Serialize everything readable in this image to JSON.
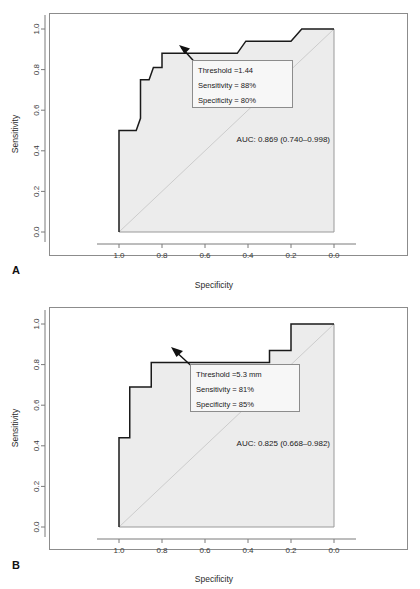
{
  "figure": {
    "panels": [
      {
        "letter": "A",
        "axes": {
          "xlabel": "Specificity",
          "ylabel": "Sensitivity",
          "xticks": [
            "1.0",
            "0.8",
            "0.6",
            "0.4",
            "0.2",
            "0.0"
          ],
          "yticks": [
            "0.0",
            "0.2",
            "0.4",
            "0.6",
            "0.8",
            "1.0"
          ],
          "xlim": [
            1.0,
            0.0
          ],
          "ylim": [
            0.0,
            1.0
          ]
        },
        "annotation": {
          "threshold": "Threshold =1.44",
          "sensitivity": "Sensitivity = 88%",
          "specificity": "Specificity = 80%"
        },
        "auc_label": "AUC: 0.869 (0.740–0.998)"
      },
      {
        "letter": "B",
        "axes": {
          "xlabel": "Specificity",
          "ylabel": "Sensitivity",
          "xticks": [
            "1.0",
            "0.8",
            "0.6",
            "0.4",
            "0.2",
            "0.0"
          ],
          "yticks": [
            "0.0",
            "0.2",
            "0.4",
            "0.6",
            "0.8",
            "1.0"
          ],
          "xlim": [
            1.0,
            0.0
          ],
          "ylim": [
            0.0,
            1.0
          ]
        },
        "annotation": {
          "threshold": "Threshold =5.3 mm",
          "sensitivity": "Sensitivity = 81%",
          "specificity": "Specificity = 85%"
        },
        "auc_label": "AUC: 0.825 (0.668–0.982)"
      }
    ]
  },
  "colors": {
    "curve": "#1a1a1a",
    "fill": "#ececec",
    "diagonal": "#cccccc",
    "axis": "#7a7a7a",
    "box": "#8c8c8c",
    "text": "#1a1a1a"
  },
  "chart_data": [
    {
      "type": "line",
      "title": "",
      "subtitle": "Panel A — ROC curve",
      "xlabel": "Specificity",
      "ylabel": "Sensitivity",
      "xlim": [
        1.0,
        0.0
      ],
      "ylim": [
        0.0,
        1.0
      ],
      "xticks": [
        1.0,
        0.8,
        0.6,
        0.4,
        0.2,
        0.0
      ],
      "yticks": [
        0.0,
        0.2,
        0.4,
        0.6,
        0.8,
        1.0
      ],
      "grid": false,
      "legend": "none",
      "reference_line": {
        "name": "chance diagonal",
        "from": [
          1.0,
          0.0
        ],
        "to": [
          0.0,
          1.0
        ]
      },
      "series": [
        {
          "name": "ROC curve",
          "points": [
            [
              1.0,
              0.0
            ],
            [
              1.0,
              0.5
            ],
            [
              0.95,
              0.5
            ],
            [
              0.92,
              0.5
            ],
            [
              0.9,
              0.56
            ],
            [
              0.9,
              0.75
            ],
            [
              0.86,
              0.75
            ],
            [
              0.84,
              0.81
            ],
            [
              0.8,
              0.81
            ],
            [
              0.8,
              0.88
            ],
            [
              0.45,
              0.88
            ],
            [
              0.41,
              0.94
            ],
            [
              0.2,
              0.94
            ],
            [
              0.15,
              1.0
            ],
            [
              0.0,
              1.0
            ]
          ]
        }
      ],
      "annotations": [
        {
          "name": "optimal-threshold-callout",
          "point": [
            0.8,
            0.88
          ],
          "lines": [
            "Threshold =1.44",
            "Sensitivity = 88%",
            "Specificity = 80%"
          ]
        },
        {
          "name": "auc-label",
          "text": "AUC: 0.869 (0.740–0.998)",
          "auc": 0.869,
          "ci_low": 0.74,
          "ci_high": 0.998
        }
      ]
    },
    {
      "type": "line",
      "title": "",
      "subtitle": "Panel B — ROC curve",
      "xlabel": "Specificity",
      "ylabel": "Sensitivity",
      "xlim": [
        1.0,
        0.0
      ],
      "ylim": [
        0.0,
        1.0
      ],
      "xticks": [
        1.0,
        0.8,
        0.6,
        0.4,
        0.2,
        0.0
      ],
      "yticks": [
        0.0,
        0.2,
        0.4,
        0.6,
        0.8,
        1.0
      ],
      "grid": false,
      "legend": "none",
      "reference_line": {
        "name": "chance diagonal",
        "from": [
          1.0,
          0.0
        ],
        "to": [
          0.0,
          1.0
        ]
      },
      "series": [
        {
          "name": "ROC curve",
          "points": [
            [
              1.0,
              0.0
            ],
            [
              1.0,
              0.44
            ],
            [
              0.95,
              0.44
            ],
            [
              0.95,
              0.69
            ],
            [
              0.85,
              0.69
            ],
            [
              0.85,
              0.81
            ],
            [
              0.3,
              0.81
            ],
            [
              0.3,
              0.87
            ],
            [
              0.2,
              0.87
            ],
            [
              0.2,
              1.0
            ],
            [
              0.0,
              1.0
            ]
          ]
        }
      ],
      "annotations": [
        {
          "name": "optimal-threshold-callout",
          "point": [
            0.85,
            0.81
          ],
          "lines": [
            "Threshold =5.3 mm",
            "Sensitivity = 81%",
            "Specificity = 85%"
          ]
        },
        {
          "name": "auc-label",
          "text": "AUC: 0.825 (0.668–0.982)",
          "auc": 0.825,
          "ci_low": 0.668,
          "ci_high": 0.982
        }
      ]
    }
  ]
}
